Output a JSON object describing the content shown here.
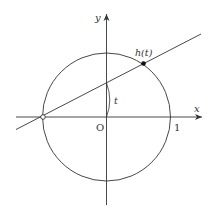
{
  "diagram": {
    "colors": {
      "stroke": "#333333",
      "background": "#ffffff"
    },
    "labels": {
      "x_axis": "x",
      "y_axis": "y",
      "origin": "O",
      "one": "1",
      "angle": "t",
      "point": "h(t)"
    },
    "elements": {
      "circle": {
        "center": [
          106.5,
          117
        ],
        "radius": 64
      },
      "line": {
        "from": [
          16,
          129.5
        ],
        "to": [
          201,
          34
        ]
      },
      "open_point": [
        43,
        117
      ],
      "filled_point": [
        143.5,
        63.5
      ],
      "angle_arc": {
        "from": [
          106.5,
          83
        ],
        "to": [
          106.5,
          117
        ]
      }
    }
  }
}
